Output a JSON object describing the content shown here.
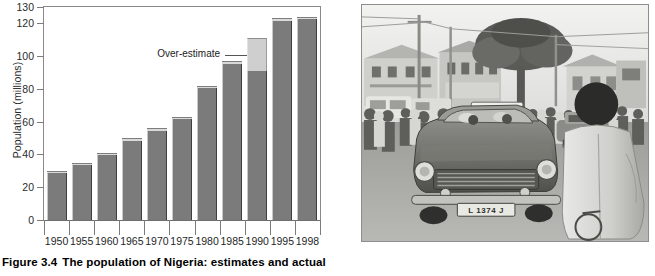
{
  "figure": {
    "caption_number": "Figure 3.4",
    "caption_text": "The population of Nigeria: estimates and actual"
  },
  "chart_data": {
    "type": "bar",
    "title": "",
    "xlabel": "",
    "ylabel": "Population (millions)",
    "ylim": [
      0,
      130
    ],
    "yticks": [
      0,
      20,
      40,
      60,
      80,
      100,
      120,
      130
    ],
    "ytick_labels": [
      "0",
      "20",
      "40",
      "60",
      "80",
      "100",
      "120",
      "130"
    ],
    "grid": false,
    "legend": "none",
    "categories": [
      "1950",
      "1955",
      "1960",
      "1965",
      "1970",
      "1975",
      "1980",
      "1985",
      "1990",
      "1995",
      "1998"
    ],
    "values": [
      30,
      35,
      41,
      50,
      56,
      63,
      82,
      97,
      111,
      123,
      124
    ],
    "series": [
      {
        "name": "Actual",
        "values": [
          30,
          35,
          41,
          50,
          56,
          63,
          82,
          97,
          91,
          123,
          124
        ]
      },
      {
        "name": "Over-estimate",
        "values": [
          0,
          0,
          0,
          0,
          0,
          0,
          0,
          0,
          20,
          0,
          0
        ]
      }
    ],
    "annotations": [
      {
        "text": "Over-estimate",
        "points_to_category": "1990",
        "points_to_value": 101
      }
    ],
    "colors": {
      "bar_actual": "#7b7b7b",
      "bar_over_estimate": "#cfcfcf",
      "axis": "#7c7c7c",
      "text": "#1f1f1f"
    }
  },
  "photo": {
    "alt_name": "nigeria-street-scene-taxi",
    "description": "Black and white photograph of a crowded street with a taxi in the foreground",
    "taxi_roof_sign": "TAXI",
    "license_plate": "L 1374 J"
  }
}
